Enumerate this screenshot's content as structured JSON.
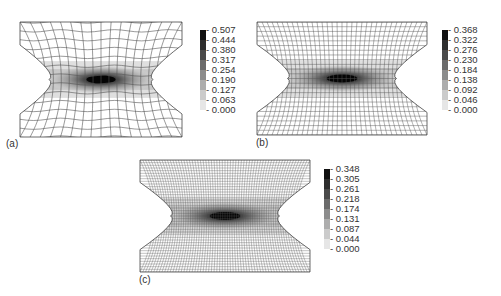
{
  "figure": {
    "panels": [
      {
        "id": "a",
        "label": "(a)",
        "mesh_density": "coarse",
        "colorbar": {
          "ticks": [
            "0.507",
            "0.444",
            "0.380",
            "0.317",
            "0.254",
            "0.190",
            "0.127",
            "0.063",
            "0.000"
          ],
          "colors": [
            "#111111",
            "#2e2e2e",
            "#4a4a4a",
            "#6b6b6b",
            "#8c8c8c",
            "#adadad",
            "#cbcbcb",
            "#e6e6e6"
          ]
        }
      },
      {
        "id": "b",
        "label": "(b)",
        "mesh_density": "medium",
        "colorbar": {
          "ticks": [
            "0.368",
            "0.322",
            "0.276",
            "0.230",
            "0.184",
            "0.138",
            "0.092",
            "0.046",
            "0.000"
          ],
          "colors": [
            "#111111",
            "#2e2e2e",
            "#4a4a4a",
            "#6b6b6b",
            "#8c8c8c",
            "#adadad",
            "#cbcbcb",
            "#e6e6e6"
          ]
        }
      },
      {
        "id": "c",
        "label": "(c)",
        "mesh_density": "fine",
        "colorbar": {
          "ticks": [
            "0.348",
            "0.305",
            "0.261",
            "0.218",
            "0.174",
            "0.131",
            "0.087",
            "0.044",
            "0.000"
          ],
          "colors": [
            "#111111",
            "#2e2e2e",
            "#4a4a4a",
            "#6b6b6b",
            "#8c8c8c",
            "#adadad",
            "#cbcbcb",
            "#e6e6e6"
          ]
        }
      }
    ]
  }
}
